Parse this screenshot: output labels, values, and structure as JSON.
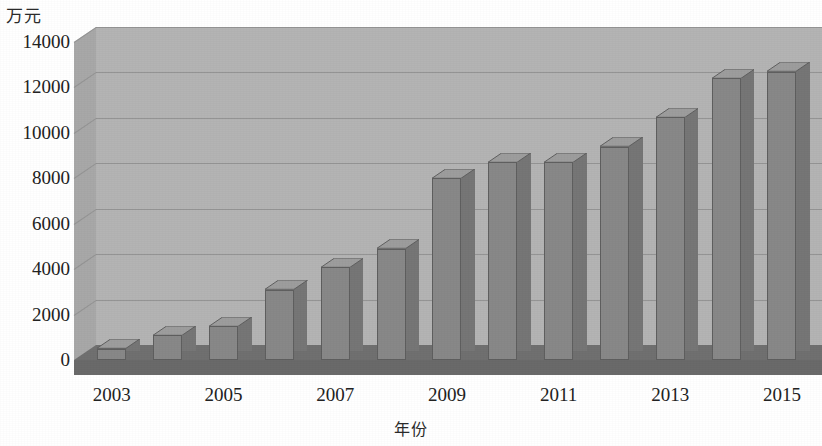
{
  "chart_data": {
    "type": "bar",
    "title": "",
    "xlabel": "年份",
    "ylabel": "万元",
    "categories": [
      "2003",
      "2004",
      "2005",
      "2006",
      "2007",
      "2008",
      "2009",
      "2010",
      "2011",
      "2012",
      "2013",
      "2014",
      "2015"
    ],
    "values": [
      500,
      1100,
      1500,
      3100,
      4100,
      4900,
      8000,
      8700,
      8700,
      9400,
      10700,
      12400,
      12700
    ],
    "series": [
      {
        "name": "",
        "values": [
          500,
          1100,
          1500,
          3100,
          4100,
          4900,
          8000,
          8700,
          8700,
          9400,
          10700,
          12400,
          12700
        ]
      }
    ],
    "ylim": [
      0,
      14000
    ],
    "ytick_labels": [
      "0",
      "2000",
      "4000",
      "6000",
      "8000",
      "10000",
      "12000",
      "14000"
    ],
    "ytick_values": [
      0,
      2000,
      4000,
      6000,
      8000,
      10000,
      12000,
      14000
    ],
    "xtick_labels": [
      "2003",
      "2005",
      "2007",
      "2009",
      "2011",
      "2013",
      "2015"
    ],
    "xtick_categories": [
      "2003",
      "2005",
      "2007",
      "2009",
      "2011",
      "2013",
      "2015"
    ],
    "grid": true,
    "legend": false,
    "legend_position": "none",
    "style": "3d-bar",
    "colors": {
      "bar_front": "#888888",
      "bar_top": "#9d9d9d",
      "bar_side": "#767676",
      "bar_outline": "#5f5f5f",
      "plot_background": "#b4b4b4",
      "floor": "#707070",
      "gridline": "#8e8e8e",
      "text": "#222222",
      "page_background": "#ffffff"
    }
  }
}
